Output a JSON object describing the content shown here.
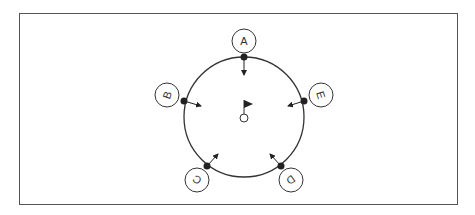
{
  "diagram": {
    "center": {
      "label": "flag-hole",
      "x": 244,
      "y": 117
    },
    "circle_radius": 60,
    "colors": {
      "line": "#333333",
      "frame": "#555555",
      "background": "#ffffff"
    },
    "players": [
      {
        "label": "A",
        "dot": [
          244,
          57
        ],
        "badge": [
          244,
          41
        ],
        "arrow_end": [
          244,
          75
        ],
        "rotation": 0
      },
      {
        "label": "B",
        "dot": [
          184,
          101
        ],
        "badge": [
          167,
          95
        ],
        "arrow_end": [
          201,
          106
        ],
        "rotation": -72
      },
      {
        "label": "C",
        "dot": [
          207,
          166
        ],
        "badge": [
          197,
          180
        ],
        "arrow_end": [
          218,
          154
        ],
        "rotation": -144
      },
      {
        "label": "D",
        "dot": [
          281,
          166
        ],
        "badge": [
          291,
          180
        ],
        "arrow_end": [
          270,
          154
        ],
        "rotation": 144
      },
      {
        "label": "E",
        "dot": [
          304,
          101
        ],
        "badge": [
          321,
          95
        ],
        "arrow_end": [
          288,
          106
        ],
        "rotation": 72
      }
    ]
  }
}
